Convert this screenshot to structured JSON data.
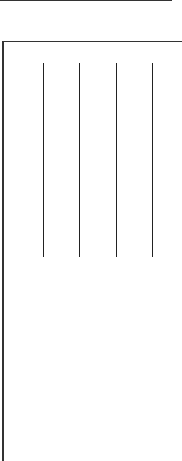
{
  "top_rule": {
    "color": "#333333"
  },
  "panel": {
    "border_color": "#333333"
  },
  "vertical_lines": [
    {
      "x": 43,
      "y_start": 63,
      "y_end": 257
    },
    {
      "x": 79,
      "y_start": 63,
      "y_end": 257
    },
    {
      "x": 116,
      "y_start": 63,
      "y_end": 257
    },
    {
      "x": 152,
      "y_start": 63,
      "y_end": 257
    }
  ]
}
